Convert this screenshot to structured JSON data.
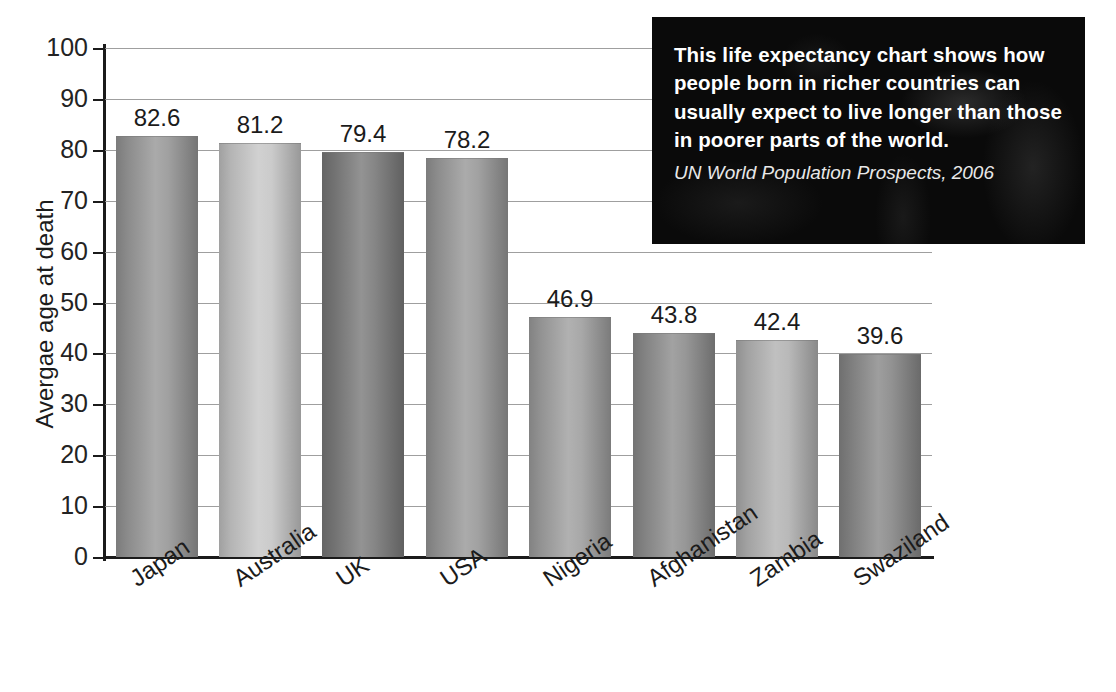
{
  "chart_data": {
    "type": "bar",
    "xlabel": "",
    "ylabel": "Avergae age at death",
    "ylim": [
      0,
      100
    ],
    "ytick_step": 10,
    "yticks": [
      0,
      10,
      20,
      30,
      40,
      50,
      60,
      70,
      80,
      90,
      100
    ],
    "grid": true,
    "legend": "none",
    "categories": [
      "Japan",
      "Australia",
      "UK",
      "USA",
      "Nigeria",
      "Afghanistan",
      "Zambia",
      "Swaziland"
    ],
    "values": [
      82.6,
      81.2,
      79.4,
      78.2,
      46.9,
      43.8,
      42.4,
      39.6
    ],
    "value_labels": [
      "82.6",
      "81.2",
      "79.4",
      "78.2",
      "46.9",
      "43.8",
      "42.4",
      "39.6"
    ],
    "bar_colors": [
      "#9a9a9a",
      "#c8c8c8",
      "#7e7e7e",
      "#9b9b9b",
      "#a2a2a2",
      "#909090",
      "#b4b4b4",
      "#8b8b8b"
    ],
    "annotation": {
      "body": "This life expectancy chart shows how people born in richer countries can usually expect to live longer than those in poorer parts of the world.",
      "source": "UN World Population Prospects, 2006",
      "background": "#0a0a0a",
      "text_color": "#ffffff"
    }
  },
  "axis": {
    "axis_color": "#1b1b1b",
    "grid_color": "#8e8e8e"
  }
}
